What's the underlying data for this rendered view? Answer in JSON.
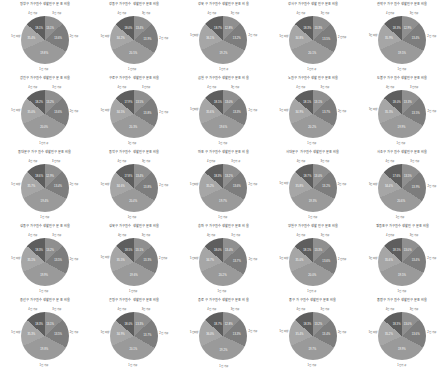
{
  "figure": {
    "layout": "grid",
    "rows": 5,
    "cols": 5,
    "count": 25,
    "background": "#ffffff",
    "title_color": "#3a3a3a",
    "inner_label_color": "#ffffff",
    "outer_label_color": "#4a4a4a"
  },
  "palette": {
    "s0": "#9a9a9a",
    "s1": "#7d7d7d",
    "s2": "#8f8f8f",
    "s3": "#5e5e5e",
    "s4": "#a6a6a6"
  },
  "chart_data": {
    "type": "pie",
    "shared_categories": [
      "1인 가구",
      "2인 가구",
      "3인 가구",
      "4인 가구",
      "5인 이상"
    ],
    "legend": "none",
    "grid": false,
    "charts": [
      {
        "title": "평창구 가구원수 생활인구 분포 비율",
        "values": [
          35.4,
          19.8,
          13.1,
          13.6,
          18.1
        ],
        "outer": [
          "13.1%",
          "13.6%",
          "19.8%",
          "35.4%",
          "18.1%"
        ]
      },
      {
        "title": "강동구 가구원수 생활인구 분포 비율",
        "values": [
          34.2,
          20.5,
          13.4,
          13.9,
          18.0
        ],
        "outer": [
          "13.4%",
          "13.9%",
          "20.5%",
          "34.2%",
          "18.0%"
        ]
      },
      {
        "title": "강북구 가구원수 생활인구 분포 비율",
        "values": [
          36.1,
          19.2,
          12.8,
          13.2,
          18.7
        ],
        "outer": [
          "12.8%",
          "13.2%",
          "19.2%",
          "36.1%",
          "18.7%"
        ]
      },
      {
        "title": "강서구 가구원수 생활인구 분포 비율",
        "values": [
          34.8,
          20.1,
          13.3,
          13.5,
          18.3
        ],
        "outer": [
          "13.3%",
          "13.5%",
          "20.1%",
          "34.8%",
          "18.3%"
        ]
      },
      {
        "title": "관악구 가구원수 생활인구 분포 비율",
        "values": [
          35.9,
          19.5,
          12.9,
          13.4,
          18.3
        ],
        "outer": [
          "12.9%",
          "13.4%",
          "19.5%",
          "35.9%",
          "18.3%"
        ]
      },
      {
        "title": "광진구 가구원수 생활인구 분포 비율",
        "values": [
          35.0,
          20.0,
          13.2,
          13.6,
          18.2
        ],
        "outer": [
          "13.2%",
          "13.6%",
          "20.0%",
          "35.0%",
          "18.2%"
        ]
      },
      {
        "title": "구로구 가구원수 생활인구 분포 비율",
        "values": [
          34.5,
          20.3,
          13.5,
          13.8,
          17.9
        ],
        "outer": [
          "13.5%",
          "13.8%",
          "20.3%",
          "34.5%",
          "17.9%"
        ]
      },
      {
        "title": "금천구 가구원수 생활인구 분포 비율",
        "values": [
          35.6,
          19.6,
          13.0,
          13.3,
          18.5
        ],
        "outer": [
          "13.0%",
          "13.3%",
          "19.6%",
          "35.6%",
          "18.5%"
        ]
      },
      {
        "title": "노원구 가구원수 생활인구 분포 비율",
        "values": [
          34.9,
          20.2,
          13.1,
          13.7,
          18.1
        ],
        "outer": [
          "13.1%",
          "13.7%",
          "20.2%",
          "34.9%",
          "18.1%"
        ]
      },
      {
        "title": "도봉구 가구원수 생활인구 분포 비율",
        "values": [
          35.3,
          19.9,
          13.3,
          13.5,
          18.0
        ],
        "outer": [
          "13.3%",
          "13.5%",
          "19.9%",
          "35.3%",
          "18.0%"
        ]
      },
      {
        "title": "동대문구 가구원수 생활인구 분포 비율",
        "values": [
          35.7,
          19.4,
          12.9,
          13.4,
          18.6
        ],
        "outer": [
          "12.9%",
          "13.4%",
          "19.4%",
          "35.7%",
          "18.6%"
        ]
      },
      {
        "title": "동작구 가구원수 생활인구 분포 비율",
        "values": [
          34.6,
          20.4,
          13.4,
          13.8,
          17.8
        ],
        "outer": [
          "13.4%",
          "13.8%",
          "20.4%",
          "34.6%",
          "17.8%"
        ]
      },
      {
        "title": "마포구 가구원수 생활인구 분포 비율",
        "values": [
          35.2,
          19.7,
          13.2,
          13.6,
          18.3
        ],
        "outer": [
          "13.2%",
          "13.6%",
          "19.7%",
          "35.2%",
          "18.3%"
        ]
      },
      {
        "title": "서대문구 가구원수 생활인구 분포 비율",
        "values": [
          35.8,
          19.3,
          13.0,
          13.2,
          18.7
        ],
        "outer": [
          "13.0%",
          "13.2%",
          "19.3%",
          "35.8%",
          "18.7%"
        ]
      },
      {
        "title": "서초구 가구원수 생활인구 분포 비율",
        "values": [
          34.4,
          20.6,
          13.5,
          13.9,
          17.6
        ],
        "outer": [
          "13.5%",
          "13.9%",
          "20.6%",
          "34.4%",
          "17.6%"
        ]
      },
      {
        "title": "성동구 가구원수 생활인구 분포 비율",
        "values": [
          35.1,
          19.9,
          13.2,
          13.5,
          18.3
        ],
        "outer": [
          "13.2%",
          "13.5%",
          "19.9%",
          "35.1%",
          "18.3%"
        ]
      },
      {
        "title": "성북구 가구원수 생활인구 분포 비율",
        "values": [
          35.5,
          19.6,
          13.1,
          13.3,
          18.5
        ],
        "outer": [
          "13.1%",
          "13.3%",
          "19.6%",
          "35.5%",
          "18.5%"
        ]
      },
      {
        "title": "송파구 가구원수 생활인구 분포 비율",
        "values": [
          34.7,
          20.2,
          13.4,
          13.7,
          18.0
        ],
        "outer": [
          "13.4%",
          "13.7%",
          "20.2%",
          "34.7%",
          "18.0%"
        ]
      },
      {
        "title": "양천구 가구원수 생활인구 분포 비율",
        "values": [
          35.0,
          20.0,
          13.3,
          13.6,
          18.1
        ],
        "outer": [
          "13.3%",
          "13.6%",
          "20.0%",
          "35.0%",
          "18.1%"
        ]
      },
      {
        "title": "영등포구 가구원수 생활인구 분포 비율",
        "values": [
          35.6,
          19.5,
          13.0,
          13.4,
          18.5
        ],
        "outer": [
          "13.0%",
          "13.4%",
          "19.5%",
          "35.6%",
          "18.5%"
        ]
      },
      {
        "title": "용산구 가구원수 생활인구 분포 비율",
        "values": [
          35.3,
          19.8,
          13.1,
          13.5,
          18.3
        ],
        "outer": [
          "13.1%",
          "13.5%",
          "19.8%",
          "35.3%",
          "18.3%"
        ]
      },
      {
        "title": "은평구 가구원수 생활인구 분포 비율",
        "values": [
          34.9,
          20.1,
          13.3,
          13.7,
          18.0
        ],
        "outer": [
          "13.3%",
          "13.7%",
          "20.1%",
          "34.9%",
          "18.0%"
        ]
      },
      {
        "title": "종로구 가구원수 생활인구 분포 비율",
        "values": [
          36.0,
          19.2,
          12.8,
          13.3,
          18.7
        ],
        "outer": [
          "12.8%",
          "13.3%",
          "19.2%",
          "36.0%",
          "18.7%"
        ]
      },
      {
        "title": "중구 가구원수 생활인구 분포 비율",
        "values": [
          35.4,
          19.7,
          13.2,
          13.4,
          18.3
        ],
        "outer": [
          "13.2%",
          "13.4%",
          "19.7%",
          "35.4%",
          "18.3%"
        ]
      },
      {
        "title": "중랑구 가구원수 생활인구 분포 비율",
        "values": [
          35.2,
          19.9,
          13.0,
          13.6,
          18.3
        ],
        "outer": [
          "13.0%",
          "13.6%",
          "19.9%",
          "35.2%",
          "18.3%"
        ]
      }
    ]
  }
}
